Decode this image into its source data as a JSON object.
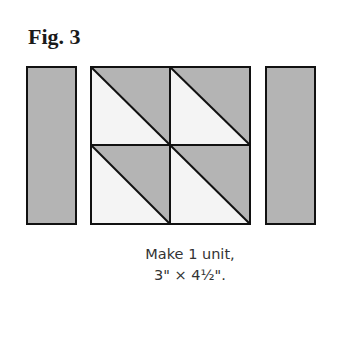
{
  "figure": {
    "title": "Fig. 3",
    "caption_line1": "Make 1 unit,",
    "caption_line2": "3\" × 4½\"."
  },
  "colors": {
    "dark_fabric": "#b4b4b4",
    "light_fabric": "#f4f4f4",
    "outline": "#111111"
  },
  "pieces": {
    "left_strip": {
      "x": 27,
      "y": 67,
      "w": 49,
      "h": 157,
      "fill": "dark"
    },
    "center_block": {
      "x": 91,
      "y": 67,
      "w": 159,
      "h": 157,
      "units": [
        {
          "row": 0,
          "col": 0,
          "type": "half-square-triangle",
          "dark": "upper-right",
          "light": "lower-left"
        },
        {
          "row": 0,
          "col": 1,
          "type": "half-square-triangle",
          "dark": "upper-right",
          "light": "lower-left"
        },
        {
          "row": 1,
          "col": 0,
          "type": "half-square-triangle",
          "dark": "upper-right",
          "light": "lower-left"
        },
        {
          "row": 1,
          "col": 1,
          "type": "half-square-triangle",
          "dark": "upper-right",
          "light": "lower-left"
        }
      ]
    },
    "right_strip": {
      "x": 266,
      "y": 67,
      "w": 49,
      "h": 157,
      "fill": "dark"
    }
  }
}
